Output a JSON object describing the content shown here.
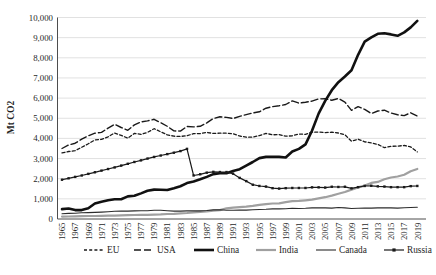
{
  "chart_data": {
    "type": "line",
    "title": "",
    "xlabel": "",
    "ylabel": "Mt CO2",
    "ylim": [
      0,
      10000
    ],
    "y_tick_step": 1000,
    "y_tick_labels": [
      "0",
      "1,000",
      "2,000",
      "3,000",
      "4,000",
      "5,000",
      "6,000",
      "7,000",
      "8,000",
      "9,000",
      "10,000"
    ],
    "x_years": [
      1965,
      1966,
      1967,
      1968,
      1969,
      1970,
      1971,
      1972,
      1973,
      1974,
      1975,
      1976,
      1977,
      1978,
      1979,
      1980,
      1981,
      1982,
      1983,
      1984,
      1985,
      1986,
      1987,
      1988,
      1989,
      1990,
      1991,
      1992,
      1993,
      1994,
      1995,
      1996,
      1997,
      1998,
      1999,
      2000,
      2001,
      2002,
      2003,
      2004,
      2005,
      2006,
      2007,
      2008,
      2009,
      2010,
      2011,
      2012,
      2013,
      2014,
      2015,
      2016,
      2017,
      2018,
      2019
    ],
    "x_tick_labels": [
      "1965",
      "1967",
      "1969",
      "1971",
      "1973",
      "1975",
      "1977",
      "1979",
      "1981",
      "1983",
      "1985",
      "1987",
      "1989",
      "1991",
      "1993",
      "1995",
      "1997",
      "1999",
      "2001",
      "2003",
      "2005",
      "2007",
      "2009",
      "2011",
      "2013",
      "2015",
      "2017",
      "2019"
    ],
    "grid": "horizontal",
    "legend_position": "bottom",
    "colors": {
      "black_series": "#1a1a1a",
      "india_gray": "#a0a0a0",
      "gridline": "#d9d9d9",
      "axis": "#4d4d4d"
    },
    "series": [
      {
        "name": "EU",
        "dash": "short",
        "width": 1.3,
        "color": "#1a1a1a",
        "marker": "none",
        "values": [
          3280,
          3350,
          3390,
          3560,
          3730,
          3920,
          3950,
          4080,
          4270,
          4150,
          4010,
          4250,
          4200,
          4300,
          4480,
          4330,
          4180,
          4110,
          4100,
          4130,
          4240,
          4240,
          4300,
          4250,
          4260,
          4260,
          4230,
          4120,
          4060,
          4060,
          4140,
          4250,
          4180,
          4190,
          4110,
          4130,
          4220,
          4200,
          4310,
          4320,
          4290,
          4310,
          4270,
          4180,
          3860,
          3960,
          3830,
          3780,
          3700,
          3540,
          3610,
          3620,
          3650,
          3580,
          3330
        ]
      },
      {
        "name": "USA",
        "dash": "long",
        "width": 1.4,
        "color": "#1a1a1a",
        "marker": "none",
        "values": [
          3500,
          3670,
          3760,
          3960,
          4130,
          4260,
          4300,
          4510,
          4700,
          4540,
          4400,
          4670,
          4820,
          4870,
          4950,
          4780,
          4600,
          4370,
          4360,
          4590,
          4570,
          4600,
          4770,
          4990,
          5070,
          5040,
          4990,
          5090,
          5180,
          5260,
          5320,
          5500,
          5580,
          5620,
          5680,
          5860,
          5750,
          5790,
          5850,
          5960,
          5970,
          5890,
          5980,
          5800,
          5390,
          5580,
          5440,
          5230,
          5360,
          5400,
          5260,
          5170,
          5130,
          5270,
          5110
        ]
      },
      {
        "name": "China",
        "dash": "solid",
        "width": 2.6,
        "color": "#111111",
        "marker": "none",
        "values": [
          490,
          520,
          440,
          440,
          530,
          770,
          860,
          930,
          980,
          980,
          1120,
          1150,
          1270,
          1400,
          1460,
          1450,
          1440,
          1530,
          1630,
          1780,
          1860,
          1970,
          2090,
          2230,
          2270,
          2270,
          2380,
          2470,
          2650,
          2830,
          3020,
          3080,
          3080,
          3080,
          3050,
          3350,
          3480,
          3700,
          4380,
          5230,
          5860,
          6390,
          6790,
          7070,
          7380,
          8150,
          8800,
          9010,
          9190,
          9220,
          9160,
          9090,
          9260,
          9510,
          9830
        ]
      },
      {
        "name": "India",
        "dash": "solid",
        "width": 2.2,
        "color": "#a0a0a0",
        "marker": "none",
        "values": [
          120,
          125,
          130,
          140,
          150,
          150,
          160,
          170,
          170,
          180,
          190,
          200,
          210,
          210,
          220,
          230,
          250,
          260,
          280,
          300,
          330,
          350,
          380,
          410,
          440,
          530,
          560,
          590,
          610,
          650,
          700,
          740,
          770,
          780,
          840,
          890,
          900,
          930,
          960,
          1020,
          1080,
          1160,
          1250,
          1340,
          1460,
          1570,
          1660,
          1790,
          1840,
          1970,
          2060,
          2110,
          2200,
          2370,
          2480
        ]
      },
      {
        "name": "Canada",
        "dash": "solid",
        "width": 1.1,
        "color": "#2b2b2b",
        "marker": "none",
        "values": [
          260,
          280,
          290,
          310,
          320,
          330,
          340,
          360,
          380,
          390,
          390,
          400,
          410,
          410,
          430,
          430,
          410,
          390,
          390,
          400,
          410,
          400,
          420,
          450,
          460,
          430,
          430,
          440,
          440,
          460,
          470,
          480,
          500,
          500,
          510,
          530,
          520,
          530,
          550,
          550,
          550,
          540,
          570,
          550,
          520,
          530,
          540,
          540,
          550,
          550,
          550,
          540,
          560,
          570,
          580
        ]
      },
      {
        "name": "Russia",
        "dash": "solid",
        "width": 1.2,
        "color": "#1a1a1a",
        "marker": "square",
        "values": [
          1950,
          2020,
          2090,
          2160,
          2240,
          2320,
          2400,
          2480,
          2560,
          2650,
          2740,
          2830,
          2910,
          3000,
          3080,
          3150,
          3220,
          3290,
          3370,
          3480,
          2160,
          2220,
          2300,
          2340,
          2330,
          2330,
          2250,
          2040,
          1880,
          1700,
          1640,
          1610,
          1530,
          1510,
          1530,
          1540,
          1540,
          1540,
          1570,
          1570,
          1560,
          1600,
          1590,
          1600,
          1520,
          1580,
          1640,
          1650,
          1620,
          1610,
          1580,
          1580,
          1580,
          1630,
          1640
        ]
      }
    ],
    "legend": [
      {
        "label": "EU"
      },
      {
        "label": "USA"
      },
      {
        "label": "China"
      },
      {
        "label": "India"
      },
      {
        "label": "Canada"
      },
      {
        "label": "Russia"
      }
    ]
  }
}
